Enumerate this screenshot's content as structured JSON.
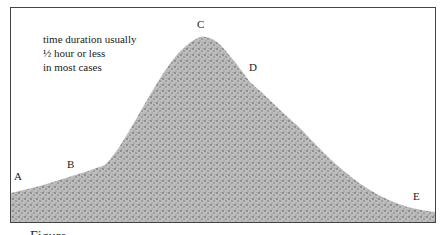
{
  "diagram": {
    "annotation": {
      "line1": "time duration usually",
      "line2": "½ hour or less",
      "line3": "in most cases"
    },
    "points": {
      "A": "A",
      "B": "B",
      "C": "C",
      "D": "D",
      "E": "E"
    },
    "caption_partial": "Figure ..."
  },
  "colors": {
    "frame": "#444444",
    "fill": "#9a9a9a",
    "text": "#222222"
  }
}
